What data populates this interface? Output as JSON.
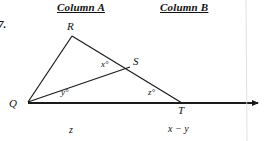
{
  "question": {
    "number": "7."
  },
  "columns": {
    "a_header": "Column A",
    "b_header": "Column B",
    "a_value": "z",
    "b_value": "x − y"
  },
  "figure": {
    "type": "geometry-diagram",
    "vertices": [
      {
        "name": "Q",
        "label": "Q",
        "x": 28,
        "y": 102
      },
      {
        "name": "R",
        "label": "R",
        "x": 72,
        "y": 36
      },
      {
        "name": "S",
        "label": "S",
        "x": 128,
        "y": 68
      },
      {
        "name": "T",
        "label": "T",
        "x": 182,
        "y": 103
      }
    ],
    "segments": [
      {
        "name": "QR",
        "from": "Q",
        "to": "R"
      },
      {
        "name": "RT",
        "from": "R",
        "to": "T"
      },
      {
        "name": "QS",
        "from": "Q",
        "to": "S"
      },
      {
        "name": "QT",
        "from": "Q",
        "to": "T"
      }
    ],
    "ray": {
      "name": "QT-extended-ray",
      "from_x": 28,
      "from_y": 103,
      "to_x": 258,
      "to_y": 103
    },
    "angle_labels": [
      {
        "name": "x",
        "label": "x°",
        "at": "S"
      },
      {
        "name": "y",
        "label": "y°",
        "at": "Q"
      },
      {
        "name": "z",
        "label": "z°",
        "at": "T"
      }
    ],
    "stroke_color": "#1a1a1a"
  }
}
